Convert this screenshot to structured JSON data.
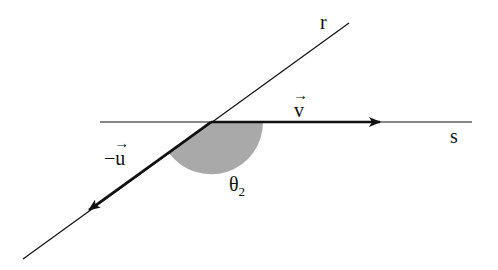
{
  "diagram": {
    "type": "angle-between-lines",
    "lines": [
      {
        "name": "r",
        "label": "r",
        "from": [
          23,
          259
        ],
        "to": [
          349,
          23
        ]
      },
      {
        "name": "s",
        "label": "s",
        "from": [
          100,
          122
        ],
        "to": [
          472,
          122
        ]
      }
    ],
    "intersection": [
      211,
      122
    ],
    "vectors": [
      {
        "name": "v",
        "label": "v",
        "from": [
          211,
          122
        ],
        "to": [
          380,
          122
        ]
      },
      {
        "name": "minus-u",
        "label": "−u",
        "from": [
          211,
          122
        ],
        "to": [
          89,
          210
        ]
      }
    ],
    "angle": {
      "label": "θ",
      "subscript": "2",
      "shade_color": "#a9a9a9",
      "radius": 52
    },
    "labels": {
      "r": "r",
      "s": "s",
      "v": "v",
      "minus_sign": "−",
      "u": "u",
      "vector_arrow": "→",
      "theta": "θ",
      "theta_sub": "2"
    }
  }
}
